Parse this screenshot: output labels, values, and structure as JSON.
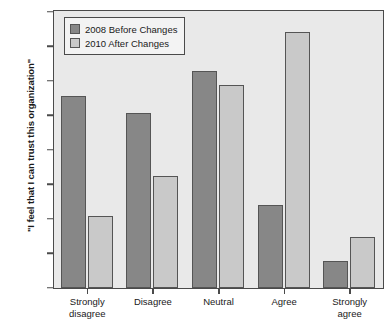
{
  "chart_data": {
    "type": "bar",
    "title": "",
    "subtitle": "",
    "xlabel": "",
    "ylabel": "\"I feel that I can trust this organization\"",
    "categories": [
      "Strongly\ndisagree",
      "Disagree",
      "Neutral",
      "Agree",
      "Strongly\nagree"
    ],
    "series": [
      {
        "name": "2008 Before Changes",
        "color": "#878787",
        "values": [
          27.8,
          25.3,
          31.4,
          12.1,
          3.9
        ]
      },
      {
        "name": "2010 After Changes",
        "color": "#c9c9c9",
        "values": [
          10.4,
          16.2,
          29.4,
          37.1,
          7.4
        ]
      }
    ],
    "ylim": [
      0,
      40
    ],
    "ytick_values": [
      0,
      5,
      10,
      15,
      20,
      25,
      30,
      35,
      40
    ],
    "ytick_labels": [
      "0%",
      "5%",
      "10%",
      "15%",
      "20%",
      "25%",
      "30%",
      "35%",
      "40%"
    ],
    "value_suffix": "%",
    "grid": false,
    "legend_position": "upper-left-inside",
    "plot_background": "#e9e9e9",
    "frame_color": "#4a4a4a",
    "page_background": "#ffffff"
  },
  "legend": {
    "items": [
      {
        "label": "2008 Before Changes",
        "color": "#878787"
      },
      {
        "label": "2010 After Changes",
        "color": "#c9c9c9"
      }
    ]
  }
}
